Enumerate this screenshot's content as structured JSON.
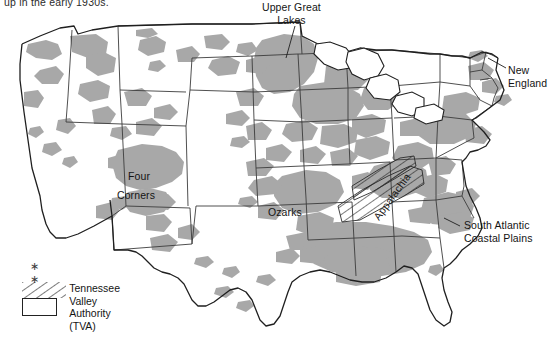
{
  "figure": {
    "caption_clipped": "up in the early 1930s.",
    "type": "thematic-map",
    "region": "United States"
  },
  "map_data": {
    "type": "choropleth-region-map",
    "title": "",
    "shaded_meaning": "depressed / low-income rural areas",
    "colors": {
      "land": "#ffffff",
      "shaded_region": "#a8a8a8",
      "state_border": "#3c3c3c",
      "coastline": "#2a2a2a",
      "hatch": "#222222",
      "text": "#141414"
    },
    "annotations": [
      {
        "id": "upper-great-lakes",
        "label": "Upper Great\nLakes",
        "line1": "Upper Great",
        "line2": "Lakes",
        "x": 265,
        "y": 2,
        "leader": true
      },
      {
        "id": "new-england",
        "label": "New\nEngland",
        "line1": "New",
        "line2": "England",
        "x": 508,
        "y": 64,
        "leader": true
      },
      {
        "id": "four-corners",
        "label": "Four\nCorners",
        "line1": "Four",
        "line2": "Corners",
        "x": 117,
        "y": 170,
        "leader": false
      },
      {
        "id": "ozarks",
        "label": "Ozarks",
        "line1": "Ozarks",
        "line2": "",
        "x": 268,
        "y": 206,
        "leader": false
      },
      {
        "id": "appalachia",
        "label": "Appalachia",
        "line1": "Appalachia",
        "line2": "",
        "x": 381,
        "y": 210,
        "rotation": -54,
        "leader": false
      },
      {
        "id": "south-atlantic-coastal-plains",
        "label": "South Atlantic\nCoastal Plains",
        "line1": "South Atlantic",
        "line2": "Coastal Plains",
        "x": 462,
        "y": 221,
        "leader": true
      }
    ],
    "legend": {
      "asterisks": "∗  ∗",
      "entries": [
        {
          "pattern": "diagonal-hatch",
          "line1": "Tennessee Valley",
          "line2": "Authority (TVA)"
        }
      ]
    }
  }
}
